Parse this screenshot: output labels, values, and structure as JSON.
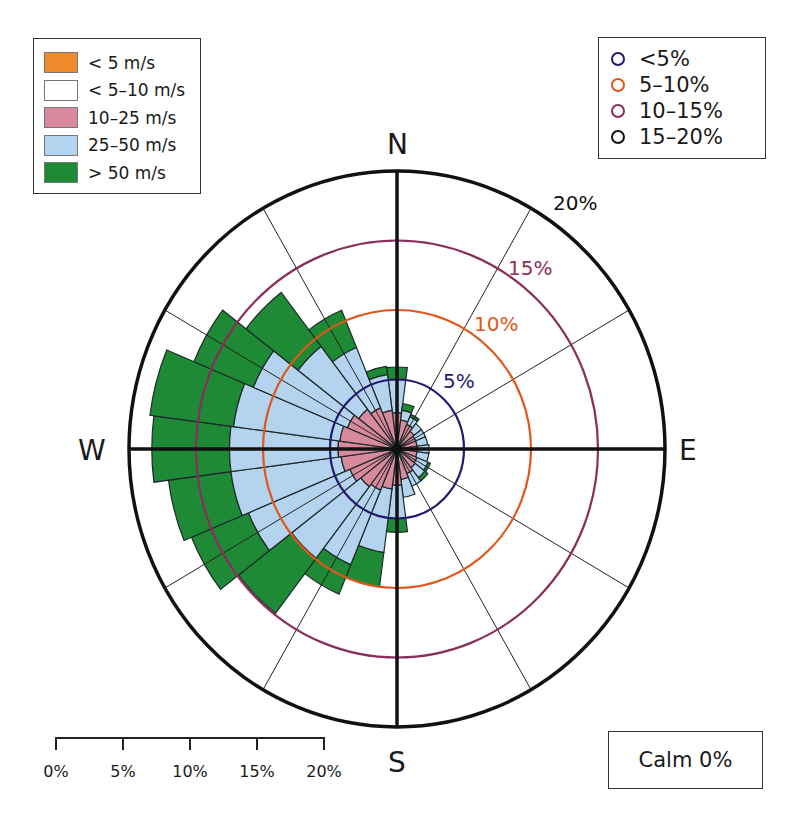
{
  "chart_data": {
    "type": "wind-rose",
    "title": "",
    "directions_deg": [
      0,
      15,
      30,
      45,
      60,
      75,
      90,
      105,
      120,
      135,
      150,
      165,
      180,
      195,
      210,
      225,
      240,
      255,
      270,
      285,
      300,
      315,
      330,
      345
    ],
    "direction_labels": {
      "N": "N",
      "E": "E",
      "S": "S",
      "W": "W"
    },
    "speed_bins": [
      "< 5 m/s",
      "< 5–10 m/s",
      "10–25 m/s",
      "25–50 m/s",
      "> 50 m/s"
    ],
    "speed_colors": [
      "#f08a2c",
      "#ffffff",
      "#d9899e",
      "#b4d3ee",
      "#1f8a35"
    ],
    "cumulative_percent": {
      "note": "outer radius (%) of each speed band per direction; < 5 m/s and 5–10 m/s bands are 0",
      "10-25": [
        2.6,
        2.1,
        1.9,
        1.6,
        1.5,
        1.5,
        1.5,
        1.5,
        1.6,
        1.7,
        1.9,
        2.2,
        2.6,
        2.9,
        3.2,
        3.4,
        3.8,
        4.2,
        4.4,
        4.3,
        4.0,
        3.6,
        3.2,
        2.8
      ],
      "25-50": [
        5.0,
        2.8,
        2.5,
        2.3,
        2.3,
        2.3,
        2.4,
        2.4,
        2.5,
        2.6,
        2.9,
        3.5,
        5.0,
        7.5,
        9.0,
        9.9,
        12.0,
        12.5,
        12.5,
        12.3,
        11.6,
        9.3,
        7.9,
        5.4
      ],
      "over50": [
        5.9,
        3.3,
        2.7,
        2.3,
        2.3,
        2.3,
        2.4,
        2.4,
        2.7,
        2.9,
        2.9,
        3.5,
        6.0,
        10.0,
        11.3,
        14.9,
        16.6,
        17.2,
        18.3,
        18.6,
        16.4,
        14.2,
        10.8,
        6.0
      ]
    },
    "rings": [
      {
        "label": "5%",
        "value": 5,
        "color": "#1f1a6e"
      },
      {
        "label": "10%",
        "value": 10,
        "color": "#e0571c"
      },
      {
        "label": "15%",
        "value": 15,
        "color": "#8a2e5c"
      },
      {
        "label": "20%",
        "value": 20,
        "color": "#111111"
      }
    ],
    "rmax": 20,
    "calm_percent": 0
  },
  "legend_speed": {
    "items": [
      {
        "label": "< 5 m/s",
        "color": "#f08a2c"
      },
      {
        "label": "< 5–10 m/s",
        "color": "#ffffff"
      },
      {
        "label": "10–25 m/s",
        "color": "#d9899e"
      },
      {
        "label": "25–50 m/s",
        "color": "#b4d3ee"
      },
      {
        "label": "> 50 m/s",
        "color": "#1f8a35"
      }
    ]
  },
  "legend_freq": {
    "items": [
      {
        "label": "<5%",
        "color": "#1f1a6e"
      },
      {
        "label": "5–10%",
        "color": "#e0571c"
      },
      {
        "label": "10–15%",
        "color": "#8a2e5c"
      },
      {
        "label": "15–20%",
        "color": "#111111"
      }
    ]
  },
  "compass": {
    "n": "N",
    "e": "E",
    "s": "S",
    "w": "W"
  },
  "ring_labels": {
    "r5": "5%",
    "r10": "10%",
    "r15": "15%",
    "r20": "20%"
  },
  "scale_bar": {
    "ticks": [
      "0%",
      "5%",
      "10%",
      "15%",
      "20%"
    ]
  },
  "calm": {
    "label": "Calm 0%"
  }
}
